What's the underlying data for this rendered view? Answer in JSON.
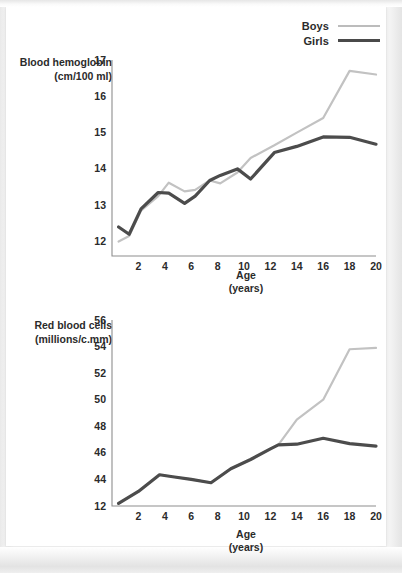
{
  "legend": {
    "items": [
      {
        "label": "Boys",
        "color": "#c2c2c2"
      },
      {
        "label": "Girls",
        "color": "#4c4c4c"
      }
    ]
  },
  "chart_data": [
    {
      "type": "line",
      "id": "blood-hemoglobin",
      "title": "",
      "ylabel_line1": "Blood hemoglobin",
      "ylabel_line2": "(cm/100 ml)",
      "xlabel_line1": "Age",
      "xlabel_line2": "(years)",
      "xlim": [
        0,
        20
      ],
      "ylim": [
        11.6,
        17
      ],
      "yticks": [
        12,
        13,
        14,
        15,
        16,
        17
      ],
      "ytick_labels": [
        "12",
        "13",
        "14",
        "15",
        "16",
        "17"
      ],
      "xticks": [
        2,
        4,
        6,
        8,
        10,
        12,
        14,
        16,
        18,
        20
      ],
      "xtick_labels": [
        "2",
        "4",
        "6",
        "8",
        "10",
        "12",
        "14",
        "16",
        "18",
        "20"
      ],
      "grid": false,
      "legend_position": "top-right",
      "x": [
        0.5,
        1.3,
        2.2,
        3.5,
        4.3,
        5.5,
        6.3,
        7.4,
        8.2,
        9.5,
        10.5,
        12.3,
        14.0,
        16.0,
        18.0,
        20.0
      ],
      "series": [
        {
          "name": "Boys",
          "color": "#c2c2c2",
          "values": [
            12.0,
            12.15,
            12.85,
            13.25,
            13.62,
            13.38,
            13.42,
            13.68,
            13.6,
            13.9,
            14.3,
            14.65,
            15.0,
            15.4,
            16.7,
            16.6
          ]
        },
        {
          "name": "Girls",
          "color": "#4c4c4c",
          "values": [
            12.4,
            12.2,
            12.9,
            13.35,
            13.33,
            13.05,
            13.25,
            13.68,
            13.82,
            14.0,
            13.72,
            14.45,
            14.62,
            14.88,
            14.87,
            14.68
          ]
        }
      ]
    },
    {
      "type": "line",
      "id": "red-blood-cells",
      "title": "",
      "ylabel_line1": "Red blood cells",
      "ylabel_line2": "(millions/c.mm)",
      "xlabel_line1": "Age",
      "xlabel_line2": "(years)",
      "xlim": [
        0,
        20
      ],
      "ylim": [
        42,
        56
      ],
      "yticks": [
        42,
        44,
        46,
        48,
        50,
        52,
        54,
        56
      ],
      "ytick_labels": [
        "12",
        "44",
        "46",
        "48",
        "50",
        "52",
        "54",
        "56"
      ],
      "xticks": [
        2,
        4,
        6,
        8,
        10,
        12,
        14,
        16,
        18,
        20
      ],
      "xtick_labels": [
        "2",
        "4",
        "6",
        "8",
        "10",
        "12",
        "14",
        "16",
        "18",
        "20"
      ],
      "grid": false,
      "legend_position": "top-right",
      "x": [
        0.5,
        2.0,
        3.6,
        4.6,
        6.0,
        7.5,
        9.0,
        10.5,
        12.0,
        12.6,
        14.0,
        16.0,
        18.0,
        20.0
      ],
      "series": [
        {
          "name": "Boys",
          "color": "#c2c2c2",
          "values": [
            42.2,
            43.1,
            44.35,
            44.2,
            44.0,
            43.75,
            44.8,
            45.5,
            46.3,
            46.6,
            48.5,
            50.0,
            53.8,
            53.9
          ]
        },
        {
          "name": "Girls",
          "color": "#4c4c4c",
          "values": [
            42.2,
            43.1,
            44.35,
            44.2,
            44.0,
            43.75,
            44.8,
            45.5,
            46.3,
            46.6,
            46.65,
            47.1,
            46.7,
            46.5
          ]
        }
      ]
    }
  ]
}
